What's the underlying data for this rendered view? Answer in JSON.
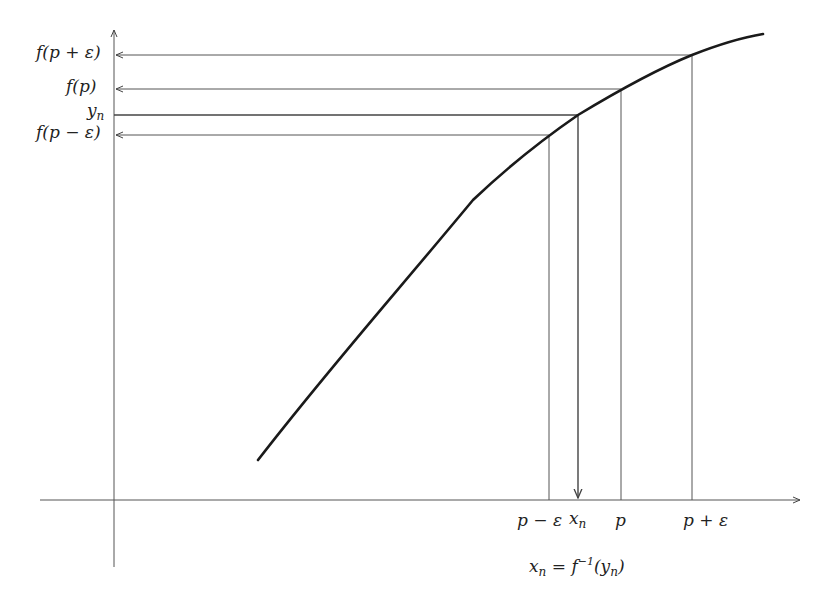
{
  "diagram": {
    "type": "inverse-function-continuity-diagram",
    "y_labels": {
      "f_p_plus_eps": "f(p + ε)",
      "f_p": "f(p)",
      "y_n": "y",
      "y_n_sub": "n",
      "f_p_minus_eps": "f(p − ε)"
    },
    "x_labels": {
      "p_minus_eps": "p − ε",
      "x_n": "x",
      "x_n_sub": "n",
      "p": "p",
      "p_plus_eps": "p + ε"
    },
    "formula": {
      "lhs": "x",
      "lhs_sub": "n",
      "eq": " = f",
      "sup": "−1",
      "open": "(y",
      "arg_sub": "n",
      "close": ")"
    },
    "colors": {
      "curve": "#1a1a1a",
      "guide": "#555555"
    }
  }
}
